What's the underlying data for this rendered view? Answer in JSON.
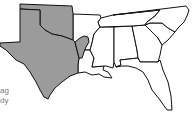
{
  "map": {
    "region": "Southern United States",
    "colors": {
      "shaded": "#9b9b9b",
      "unshaded": "#ffffff",
      "border": "#111111",
      "label_text": "#777777"
    },
    "shaded_states": [
      "Texas",
      "Oklahoma",
      "western Arkansas (partial)",
      "northwestern Louisiana (partial)"
    ],
    "unshaded_states": [
      "Arkansas",
      "Louisiana",
      "Mississippi",
      "Alabama",
      "Georgia",
      "Florida",
      "Tennessee",
      "South Carolina",
      "North Carolina"
    ]
  },
  "legend_fragments": [
    "ag",
    "dy"
  ]
}
